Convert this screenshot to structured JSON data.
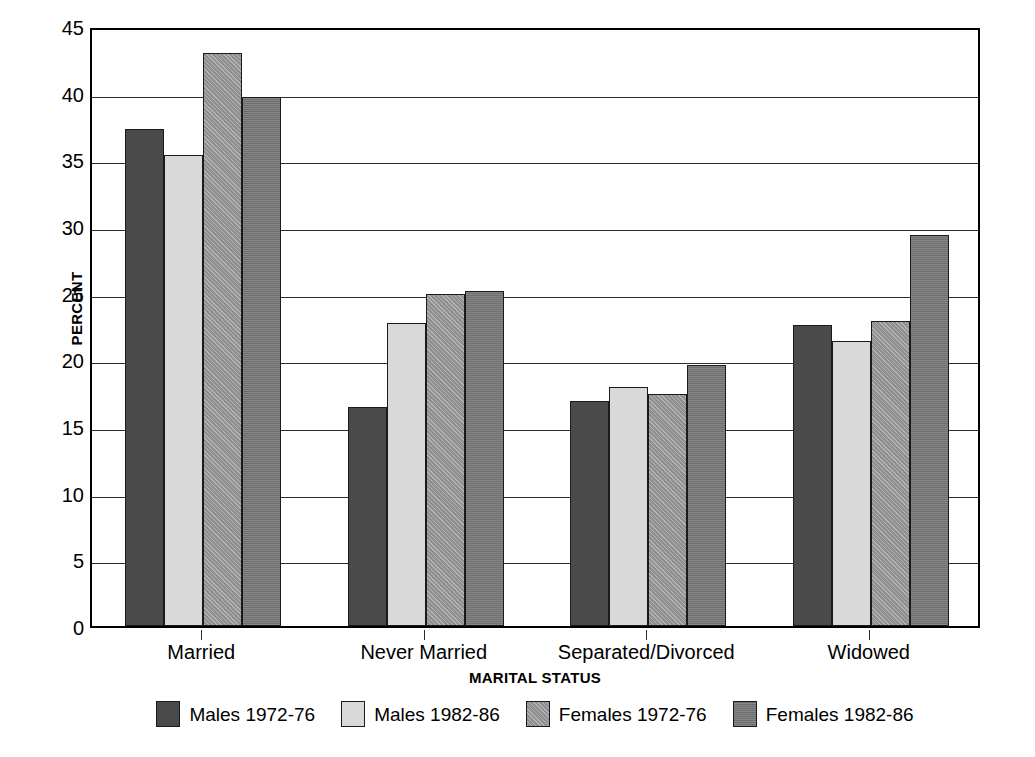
{
  "chart_data": {
    "type": "bar",
    "title": "",
    "subtitle": "",
    "xlabel": "MARITAL STATUS",
    "ylabel": "PERCENT",
    "categories": [
      "Married",
      "Never Married",
      "Separated/Divorced",
      "Widowed"
    ],
    "series": [
      {
        "name": "Males 1972-76",
        "color": "#4a4a4a",
        "values": [
          37.3,
          16.4,
          16.9,
          22.6
        ]
      },
      {
        "name": "Males 1982-86",
        "color": "#d9d9d9",
        "values": [
          35.3,
          22.7,
          17.9,
          21.4
        ]
      },
      {
        "name": "Females 1972-76",
        "color": "#8f8f8f",
        "values": [
          43.0,
          24.9,
          17.4,
          22.9
        ]
      },
      {
        "name": "Females 1982-86",
        "color": "#6f6f6f",
        "values": [
          39.7,
          25.1,
          19.6,
          29.3
        ]
      }
    ],
    "ylim": [
      0,
      45
    ],
    "ytick_step": 5,
    "yticks": [
      0,
      5,
      10,
      15,
      20,
      25,
      30,
      35,
      40,
      45
    ],
    "ytick_labels": [
      "0",
      "5",
      "10",
      "15",
      "20",
      "25",
      "30",
      "35",
      "40",
      "45"
    ],
    "grid": true,
    "grid_axis": "y",
    "legend_position": "bottom",
    "bar_gap_ratio": 0.0,
    "group_padding_ratio": 0.3
  }
}
